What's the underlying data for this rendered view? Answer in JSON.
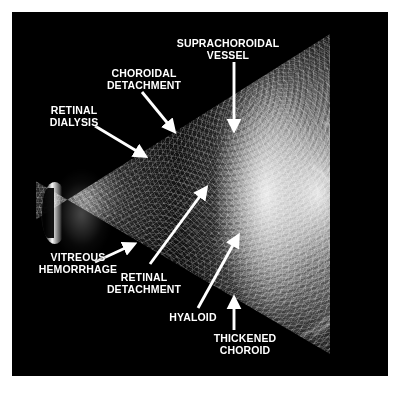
{
  "figure": {
    "type": "ocular-b-scan-ultrasound",
    "background_color": "#ffffff",
    "panel_color": "#000000",
    "label_color": "#ffffff",
    "arrow_color": "#ffffff"
  },
  "annotations": [
    {
      "id": "suprachoroidal-vessel",
      "text": "SUPRACHOROIDAL\nVESSEL",
      "label_x": 168,
      "label_y": 38,
      "arrow": {
        "x1": 234,
        "y1": 62,
        "x2": 234,
        "y2": 133,
        "style": "straight-vertical"
      }
    },
    {
      "id": "choroidal-detachment",
      "text": "CHOROIDAL\nDETACHMENT",
      "label_x": 92,
      "label_y": 68,
      "arrow": {
        "x1": 142,
        "y1": 92,
        "x2": 176,
        "y2": 134,
        "style": "diagonal-down-right"
      }
    },
    {
      "id": "retinal-dialysis",
      "text": "RETINAL\nDIALYSIS",
      "label_x": 36,
      "label_y": 105,
      "arrow": {
        "x1": 95,
        "y1": 126,
        "x2": 147,
        "y2": 158,
        "style": "diagonal-down-right"
      }
    },
    {
      "id": "vitreous-hemorrhage",
      "text": "VITREOUS\nHEMORRHAGE",
      "label_x": 26,
      "label_y": 252,
      "arrow": {
        "x1": 95,
        "y1": 262,
        "x2": 136,
        "y2": 243,
        "style": "shallow-up-right"
      }
    },
    {
      "id": "retinal-detachment",
      "text": "RETINAL\nDETACHMENT",
      "label_x": 92,
      "label_y": 272,
      "arrow": {
        "x1": 150,
        "y1": 264,
        "x2": 208,
        "y2": 186,
        "style": "long-diagonal-up-right"
      }
    },
    {
      "id": "hyaloid",
      "text": "HYALOID",
      "label_x": 160,
      "label_y": 312,
      "arrow": {
        "x1": 198,
        "y1": 308,
        "x2": 240,
        "y2": 234,
        "style": "diagonal-up-right"
      }
    },
    {
      "id": "thickened-choroid",
      "text": "THICKENED\nCHOROID",
      "label_x": 198,
      "label_y": 333,
      "arrow": {
        "x1": 234,
        "y1": 330,
        "x2": 234,
        "y2": 296,
        "style": "straight-vertical-up"
      }
    }
  ]
}
